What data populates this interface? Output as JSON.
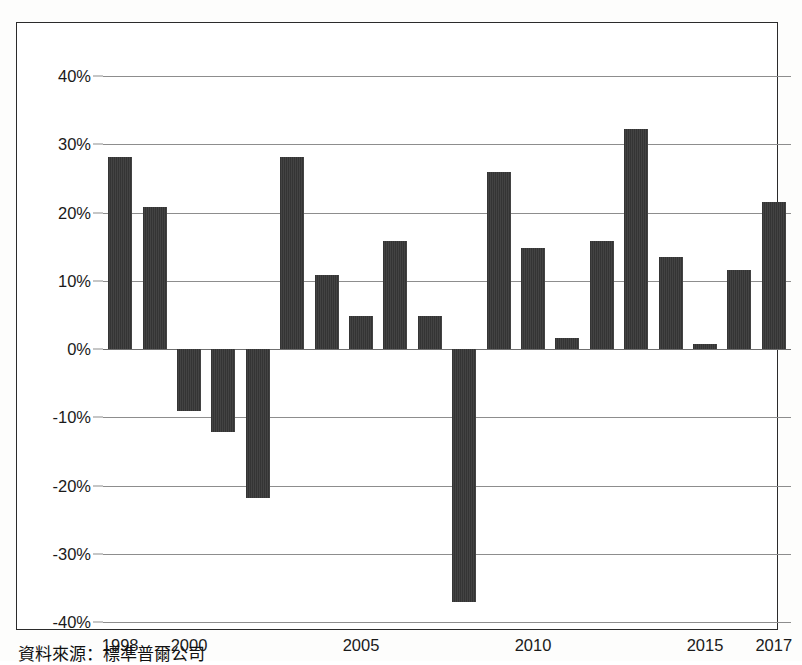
{
  "caption": "資料來源：標準普爾公司",
  "axis": {
    "y_ticks": [
      "40%",
      "30%",
      "20%",
      "10%",
      "0%",
      "-10%",
      "-20%",
      "-30%",
      "-40%"
    ],
    "x_ticks": [
      "1998",
      "2000",
      "2005",
      "2010",
      "2015",
      "2017"
    ]
  },
  "colors": {
    "bar": "#3a3a3a",
    "grid": "#8d8d8d",
    "border": "#2b2b2b",
    "background": "#ffffff",
    "text": "#1a1a1a"
  },
  "chart_data": {
    "type": "bar",
    "title": "",
    "xlabel": "",
    "ylabel": "",
    "ylim": [
      -40,
      40
    ],
    "ytick_step": 10,
    "grid": true,
    "legend": "none",
    "categories": [
      "1998",
      "1999",
      "2000",
      "2001",
      "2002",
      "2003",
      "2004",
      "2005",
      "2006",
      "2007",
      "2008",
      "2009",
      "2010",
      "2011",
      "2012",
      "2013",
      "2014",
      "2015",
      "2016",
      "2017"
    ],
    "labeled_xticks": [
      "1998",
      "2000",
      "2005",
      "2010",
      "2015",
      "2017"
    ],
    "values": [
      28.2,
      20.8,
      -9.1,
      -12.2,
      -21.8,
      28.2,
      10.9,
      4.9,
      15.8,
      4.9,
      -37.1,
      26.0,
      14.8,
      1.6,
      15.8,
      32.2,
      13.5,
      0.7,
      11.6,
      21.5
    ],
    "units": "percent",
    "value_labels_shown": false
  }
}
